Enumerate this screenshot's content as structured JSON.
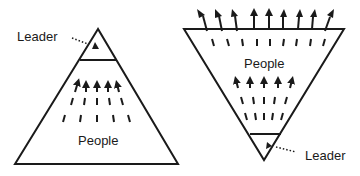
{
  "diagram": {
    "left": {
      "title": "Traditional pyramid",
      "leader_label": "Leader",
      "people_label": "People"
    },
    "right": {
      "title": "Inverted pyramid",
      "leader_label": "Leader",
      "people_label": "People"
    },
    "colors": {
      "stroke": "#1a1a1a",
      "background": "#ffffff"
    }
  }
}
